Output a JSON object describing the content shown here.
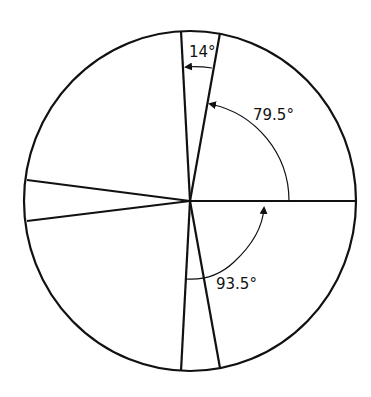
{
  "diagram": {
    "type": "circle-with-radial-lines-and-angle-annotations",
    "stroke_color": "#111111",
    "background": "#ffffff",
    "labels": {
      "top_angle": "14°",
      "upper_right_angle": "79.5°",
      "lower_angle": "93.5°"
    },
    "angles_deg": {
      "top_wedge": 14,
      "from_horizontal_to_upper_line": 79.5,
      "from_horizontal_to_lower_line": 93.5
    }
  }
}
